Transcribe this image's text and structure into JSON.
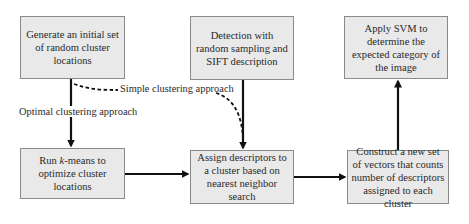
{
  "diagram": {
    "nodes": [
      {
        "id": "generate",
        "label": "Generate an initial set of random cluster locations"
      },
      {
        "id": "detection",
        "label": "Detection with random sampling and SIFT description"
      },
      {
        "id": "apply_svm",
        "label": "Apply SVM to determine the expected category of the image"
      },
      {
        "id": "run_kmeans",
        "label_prefix": "Run ",
        "label_italic": "k",
        "label_suffix": "-means to optimize cluster locations"
      },
      {
        "id": "assign",
        "label": "Assign descriptors to a cluster based on nearest neighbor search"
      },
      {
        "id": "construct",
        "label": "Construct a new set of vectors that counts number of descriptors assigned to each cluster"
      }
    ],
    "edge_labels": {
      "simple": "Simple clustering approach",
      "optimal": "Optimal clustering approach"
    },
    "edges": [
      {
        "from": "generate",
        "to": "run_kmeans",
        "style": "solid",
        "label": "Optimal clustering approach"
      },
      {
        "from": "generate",
        "to": "assign",
        "style": "dashed",
        "label": "Simple clustering approach"
      },
      {
        "from": "detection",
        "to": "assign",
        "style": "solid"
      },
      {
        "from": "run_kmeans",
        "to": "assign",
        "style": "solid"
      },
      {
        "from": "assign",
        "to": "construct",
        "style": "solid"
      },
      {
        "from": "construct",
        "to": "apply_svm",
        "style": "solid"
      }
    ],
    "colors": {
      "box_fill": "#e9e9e9",
      "box_border": "#8a8a8a",
      "arrow": "#111111"
    }
  }
}
